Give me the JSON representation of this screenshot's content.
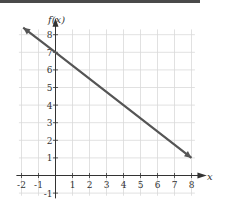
{
  "chart_data": {
    "type": "line",
    "title": "",
    "xlabel": "x",
    "ylabel": "f(x)",
    "xlim": [
      -2,
      8
    ],
    "ylim": [
      -1,
      8
    ],
    "grid": true,
    "x_ticks": [
      "-2",
      "-1",
      "1",
      "2",
      "3",
      "4",
      "5",
      "6",
      "7",
      "8"
    ],
    "y_ticks": [
      "-1",
      "1",
      "2",
      "3",
      "4",
      "5",
      "6",
      "7",
      "8"
    ],
    "series": [
      {
        "name": "f(x) = 7 - 0.75x",
        "x": [
          -1.9,
          0,
          4,
          8
        ],
        "y": [
          8.4,
          7,
          4,
          1
        ],
        "arrows": "both",
        "color": "#555555"
      }
    ]
  },
  "colors": {
    "grid": "#d9d9d9",
    "axis": "#333333",
    "line": "#555555",
    "topbar": "#4a4a4a"
  }
}
